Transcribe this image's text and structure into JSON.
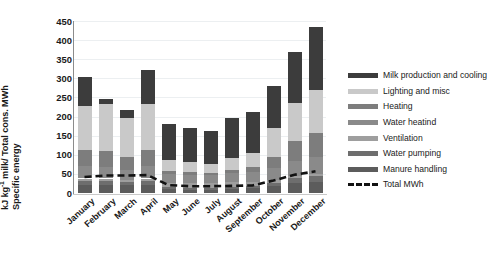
{
  "chart_data": {
    "type": "bar",
    "stacked": true,
    "title": "",
    "xlabel": "",
    "ylabel": "Specific energy / kJ kg-1 milk/ Total cons. MWh",
    "ylabel_line1": "Specific energy",
    "ylabel_line2_pre": "kJ kg",
    "ylabel_line2_sup": "-1",
    "ylabel_line2_post": " milk/ Total cons. MWh",
    "ylim": [
      0,
      450
    ],
    "yticks": [
      0,
      50,
      100,
      150,
      200,
      250,
      300,
      350,
      400,
      450
    ],
    "ytick_labels": [
      "0",
      "50",
      "100",
      "150",
      "200",
      "250",
      "300",
      "350",
      "400",
      "450"
    ],
    "grid": true,
    "legend_position": "right",
    "categories": [
      "January",
      "February",
      "March",
      "April",
      "May",
      "June",
      "July",
      "August",
      "September",
      "October",
      "November",
      "December"
    ],
    "series": [
      {
        "name": "Manure handling",
        "color": "#5c5c5c",
        "values": [
          22,
          22,
          20,
          22,
          10,
          9,
          9,
          10,
          12,
          18,
          26,
          30
        ]
      },
      {
        "name": "Water pumping",
        "color": "#6e6e6e",
        "values": [
          10,
          10,
          9,
          10,
          5,
          5,
          5,
          6,
          6,
          9,
          12,
          14
        ]
      },
      {
        "name": "Ventilation",
        "color": "#9e9e9e",
        "values": [
          6,
          6,
          6,
          6,
          12,
          12,
          12,
          12,
          12,
          8,
          7,
          6
        ]
      },
      {
        "name": "Water heatind",
        "color": "#8a8a8a",
        "values": [
          32,
          30,
          26,
          32,
          22,
          21,
          20,
          24,
          25,
          30,
          38,
          44
        ]
      },
      {
        "name": "Heating",
        "color": "#7d7d7d",
        "values": [
          42,
          42,
          34,
          42,
          8,
          7,
          7,
          9,
          12,
          30,
          52,
          62
        ]
      },
      {
        "name": "Lighting and misc",
        "color": "#c9c9c9",
        "values": [
          116,
          122,
          100,
          120,
          30,
          26,
          24,
          30,
          37,
          75,
          100,
          114
        ]
      },
      {
        "name": "Milk production and cooling",
        "color": "#3c3c3c",
        "values": [
          75,
          14,
          22,
          91,
          94,
          89,
          86,
          106,
          107,
          110,
          133,
          165
        ]
      }
    ],
    "totals": [
      303,
      246,
      217,
      323,
      181,
      169,
      163,
      197,
      211,
      280,
      368,
      435
    ],
    "line_series": {
      "name": "Total MWh",
      "color": "#121212",
      "style": "dashed",
      "values": [
        43,
        47,
        47,
        48,
        22,
        19,
        19,
        20,
        21,
        34,
        49,
        58
      ]
    }
  },
  "legend": {
    "items": [
      {
        "label": "Milk production and cooling",
        "color": "#3c3c3c",
        "type": "swatch"
      },
      {
        "label": "Lighting and misc",
        "color": "#c9c9c9",
        "type": "swatch"
      },
      {
        "label": "Heating",
        "color": "#7d7d7d",
        "type": "swatch"
      },
      {
        "label": "Water heatind",
        "color": "#8a8a8a",
        "type": "swatch"
      },
      {
        "label": "Ventilation",
        "color": "#9e9e9e",
        "type": "swatch"
      },
      {
        "label": "Water pumping",
        "color": "#6e6e6e",
        "type": "swatch"
      },
      {
        "label": "Manure handling",
        "color": "#5c5c5c",
        "type": "swatch"
      },
      {
        "label": "Total MWh",
        "color": "#121212",
        "type": "dashed-line"
      }
    ]
  }
}
